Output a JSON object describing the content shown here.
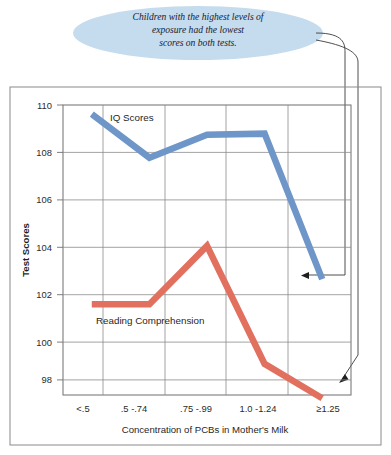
{
  "callout": {
    "lines": [
      "Children with the highest levels of",
      "exposure had the lowest",
      "scores on both tests."
    ],
    "fill_color": "#c5dcee"
  },
  "chart_data": {
    "type": "line",
    "title": "",
    "xlabel": "Concentration of PCBs in Mother's Milk",
    "ylabel": "Test Scores",
    "categories": [
      "<.5",
      ".5 -.74",
      ".75 -.99",
      "1.0 -1.24",
      "≥1.25"
    ],
    "yticks": [
      "98",
      "100",
      "102",
      "104",
      "106",
      "108",
      "110"
    ],
    "ylim": [
      97,
      111
    ],
    "grid": true,
    "legend_position": "inline-labels",
    "series": [
      {
        "name": "IQ Scores",
        "color": "#6e96c8",
        "values": [
          109.6,
          107.7,
          108.7,
          108.75,
          102.4
        ]
      },
      {
        "name": "Reading Comprehension",
        "color": "#e2705f",
        "values": [
          101.3,
          101.3,
          103.85,
          98.7,
          97.2
        ]
      }
    ]
  }
}
